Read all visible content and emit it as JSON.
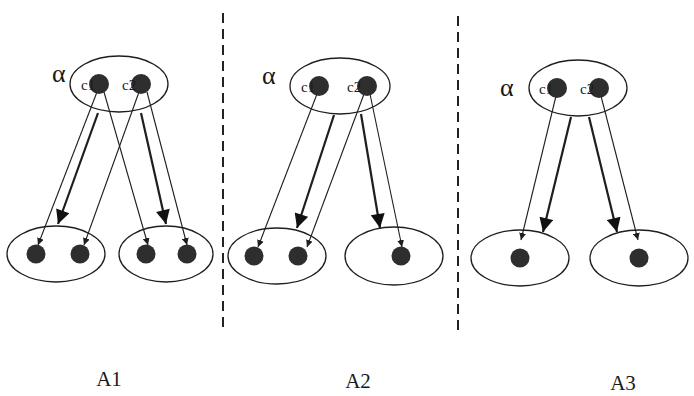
{
  "colors": {
    "background": "#ffffff",
    "stroke": "#1e1e1e",
    "dot": "#2e2e2e",
    "divider": "#222222"
  },
  "dividers": [
    {
      "x": 223,
      "y1": 13,
      "y2": 328
    },
    {
      "x": 458,
      "y1": 16,
      "y2": 330
    }
  ],
  "panels": [
    {
      "id": "A1",
      "label": "A1",
      "label_pos": {
        "x": 109,
        "y": 386
      },
      "alpha": {
        "text": "α",
        "x": 52,
        "y": 82
      },
      "source": {
        "ellipse": {
          "cx": 119,
          "cy": 84,
          "rx": 49,
          "ry": 28
        },
        "nodes": [
          {
            "name": "c1",
            "label": "c1",
            "cx": 99,
            "cy": 84,
            "lx": 81,
            "ly": 90
          },
          {
            "name": "c2",
            "label": "c2",
            "cx": 141,
            "cy": 84,
            "lx": 122,
            "ly": 90
          }
        ]
      },
      "targets": [
        {
          "ellipse": {
            "cx": 56,
            "cy": 254,
            "rx": 49,
            "ry": 28
          },
          "nodes": [
            {
              "cx": 36,
              "cy": 254
            },
            {
              "cx": 80,
              "cy": 254
            }
          ]
        },
        {
          "ellipse": {
            "cx": 166,
            "cy": 254,
            "rx": 47,
            "ry": 28
          },
          "nodes": [
            {
              "cx": 146,
              "cy": 254
            },
            {
              "cx": 187,
              "cy": 254
            }
          ]
        }
      ],
      "arrows": [
        {
          "x1": 97,
          "y1": 92,
          "x2": 38,
          "y2": 245,
          "weight": "thin"
        },
        {
          "x1": 98,
          "y1": 113,
          "x2": 58,
          "y2": 224,
          "weight": "thick"
        },
        {
          "x1": 139,
          "y1": 92,
          "x2": 84,
          "y2": 245,
          "weight": "thin"
        },
        {
          "x1": 104,
          "y1": 92,
          "x2": 148,
          "y2": 245,
          "weight": "thin"
        },
        {
          "x1": 141,
          "y1": 113,
          "x2": 166,
          "y2": 224,
          "weight": "thick"
        },
        {
          "x1": 147,
          "y1": 92,
          "x2": 187,
          "y2": 245,
          "weight": "thin"
        }
      ]
    },
    {
      "id": "A2",
      "label": "A2",
      "label_pos": {
        "x": 358,
        "y": 388
      },
      "alpha": {
        "text": "α",
        "x": 262,
        "y": 84
      },
      "source": {
        "ellipse": {
          "cx": 340,
          "cy": 86,
          "rx": 50,
          "ry": 28
        },
        "nodes": [
          {
            "name": "c1",
            "label": "c1",
            "cx": 319,
            "cy": 86,
            "lx": 301,
            "ly": 92
          },
          {
            "name": "c2",
            "label": "c2",
            "cx": 367,
            "cy": 86,
            "lx": 347,
            "ly": 92
          }
        ]
      },
      "targets": [
        {
          "ellipse": {
            "cx": 277,
            "cy": 256,
            "rx": 49,
            "ry": 28
          },
          "nodes": [
            {
              "cx": 254,
              "cy": 256
            },
            {
              "cx": 298,
              "cy": 256
            }
          ]
        },
        {
          "ellipse": {
            "cx": 394,
            "cy": 256,
            "rx": 49,
            "ry": 29
          },
          "nodes": [
            {
              "cx": 401,
              "cy": 256
            }
          ]
        }
      ],
      "arrows": [
        {
          "x1": 317,
          "y1": 94,
          "x2": 258,
          "y2": 247,
          "weight": "thin"
        },
        {
          "x1": 334,
          "y1": 115,
          "x2": 297,
          "y2": 228,
          "weight": "thick"
        },
        {
          "x1": 364,
          "y1": 94,
          "x2": 307,
          "y2": 247,
          "weight": "thin"
        },
        {
          "x1": 361,
          "y1": 114,
          "x2": 380,
          "y2": 228,
          "weight": "thick"
        },
        {
          "x1": 370,
          "y1": 94,
          "x2": 402,
          "y2": 247,
          "weight": "thin"
        }
      ]
    },
    {
      "id": "A3",
      "label": "A3",
      "label_pos": {
        "x": 623,
        "y": 390
      },
      "alpha": {
        "text": "α",
        "x": 500,
        "y": 96
      },
      "source": {
        "ellipse": {
          "cx": 578,
          "cy": 88,
          "rx": 49,
          "ry": 28
        },
        "nodes": [
          {
            "name": "c1",
            "label": "c1",
            "cx": 557,
            "cy": 88,
            "lx": 539,
            "ly": 94
          },
          {
            "name": "c2",
            "label": "c2",
            "cx": 599,
            "cy": 88,
            "lx": 580,
            "ly": 94
          }
        ]
      },
      "targets": [
        {
          "ellipse": {
            "cx": 520,
            "cy": 258,
            "rx": 49,
            "ry": 28
          },
          "nodes": [
            {
              "cx": 520,
              "cy": 258
            }
          ]
        },
        {
          "ellipse": {
            "cx": 639,
            "cy": 258,
            "rx": 49,
            "ry": 28
          },
          "nodes": [
            {
              "cx": 639,
              "cy": 258
            }
          ]
        }
      ],
      "arrows": [
        {
          "x1": 556,
          "y1": 96,
          "x2": 521,
          "y2": 240,
          "weight": "thin"
        },
        {
          "x1": 571,
          "y1": 117,
          "x2": 543,
          "y2": 232,
          "weight": "thick"
        },
        {
          "x1": 589,
          "y1": 117,
          "x2": 617,
          "y2": 232,
          "weight": "thick"
        },
        {
          "x1": 601,
          "y1": 96,
          "x2": 638,
          "y2": 240,
          "weight": "thin"
        }
      ]
    }
  ]
}
